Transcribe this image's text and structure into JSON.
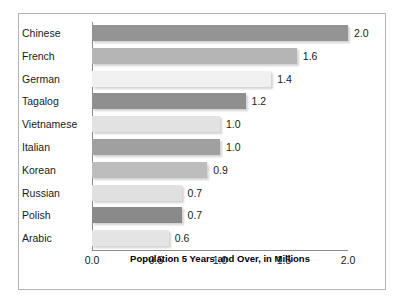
{
  "chart_data": {
    "type": "bar",
    "orientation": "horizontal",
    "title": "",
    "xlabel": "Population 5 Years and Over, in Millions",
    "ylabel": "",
    "xlim": [
      0.0,
      2.0
    ],
    "xticks": [
      "0.0",
      "0.5",
      "1.0",
      "1.5",
      "2.0"
    ],
    "xtick_values": [
      0.0,
      0.5,
      1.0,
      1.5,
      2.0
    ],
    "grid": false,
    "legend": "none",
    "categories": [
      "Chinese",
      "French",
      "German",
      "Tagalog",
      "Vietnamese",
      "Italian",
      "Korean",
      "Russian",
      "Polish",
      "Arabic"
    ],
    "values": [
      2.0,
      1.6,
      1.4,
      1.2,
      1.0,
      1.0,
      0.9,
      0.7,
      0.7,
      0.6
    ],
    "value_labels": [
      "2.0",
      "1.6",
      "1.4",
      "1.2",
      "1.0",
      "1.0",
      "0.9",
      "0.7",
      "0.7",
      "0.6"
    ],
    "bar_colors": [
      "#949494",
      "#b5b5b5",
      "#f0f0f0",
      "#8f8f8f",
      "#e2e2e2",
      "#a0a0a0",
      "#bdbdbd",
      "#e0e0e0",
      "#8a8a8a",
      "#e4e4e4"
    ]
  },
  "axis": {
    "title": "Population 5 Years and Over, in Millions"
  },
  "colors": {
    "frame_border": "#b3b3b3",
    "axis_line": "#8c8c8c",
    "text": "#1a1a1a",
    "background": "#ffffff"
  }
}
